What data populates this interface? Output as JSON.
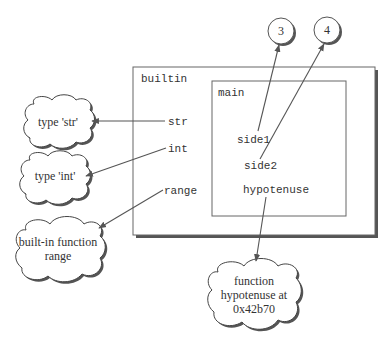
{
  "colors": {
    "line": "#555555",
    "shadow": "#555555",
    "text": "#333333",
    "background": "#ffffff"
  },
  "namespaces": {
    "builtin": {
      "label": "builtin",
      "names": [
        "str",
        "int",
        "range"
      ]
    },
    "main": {
      "label": "main",
      "names": [
        "side1",
        "side2",
        "hypotenuse"
      ]
    }
  },
  "objects": {
    "circle_3": "3",
    "circle_4": "4",
    "cloud_str": "type 'str'",
    "cloud_int": "type 'int'",
    "cloud_range": [
      "built-in function",
      "range"
    ],
    "cloud_hypotenuse": [
      "function",
      "hypotenuse at",
      "0x42b70"
    ]
  },
  "references": [
    {
      "from": "str",
      "to": "type 'str'"
    },
    {
      "from": "int",
      "to": "type 'int'"
    },
    {
      "from": "range",
      "to": "built-in function range"
    },
    {
      "from": "side1",
      "to": "3"
    },
    {
      "from": "side2",
      "to": "4"
    },
    {
      "from": "hypotenuse",
      "to": "function hypotenuse at 0x42b70"
    }
  ]
}
